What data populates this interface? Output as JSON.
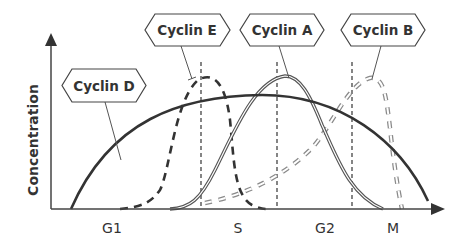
{
  "diagram": {
    "y_axis_label": "Concentration",
    "phases": [
      {
        "label": "G1"
      },
      {
        "label": "S"
      },
      {
        "label": "G2"
      },
      {
        "label": "M"
      }
    ],
    "cyclins": [
      {
        "label": "Cyclin D",
        "style": "thick-solid",
        "color": "#333333"
      },
      {
        "label": "Cyclin E",
        "style": "thick-dashed",
        "color": "#333333"
      },
      {
        "label": "Cyclin A",
        "style": "double-line",
        "color": "#555555"
      },
      {
        "label": "Cyclin B",
        "style": "hollow-dashed",
        "color": "#9a9a9a"
      }
    ]
  }
}
